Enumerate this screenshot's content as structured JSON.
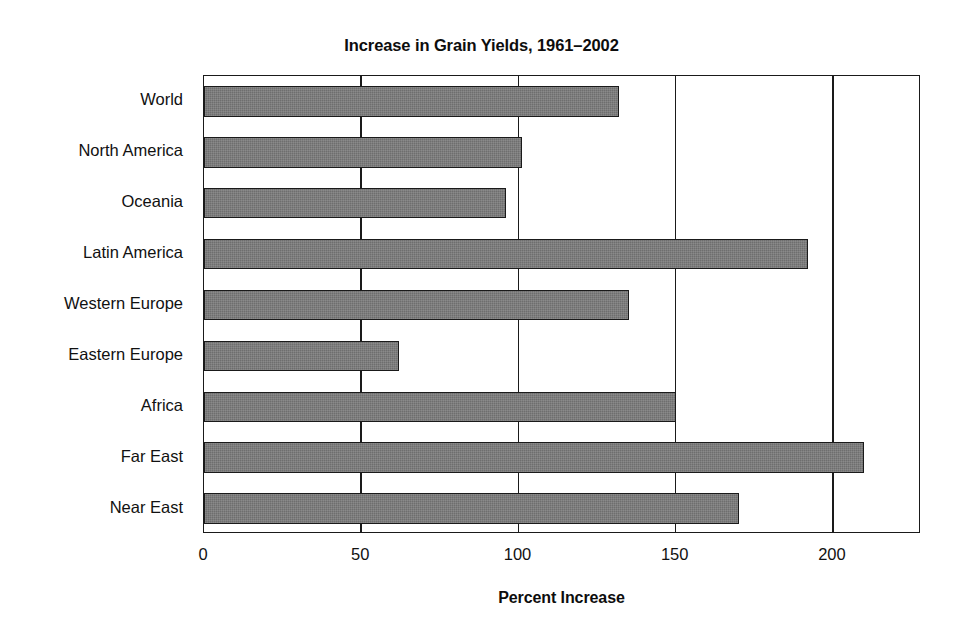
{
  "chart_data": {
    "type": "bar",
    "orientation": "horizontal",
    "title": "Increase in Grain Yields, 1961–2002",
    "xlabel": "Percent Increase",
    "ylabel": "",
    "categories": [
      "World",
      "North America",
      "Oceania",
      "Latin America",
      "Western Europe",
      "Eastern Europe",
      "Africa",
      "Far East",
      "Near East"
    ],
    "values": [
      132,
      101,
      96,
      192,
      135,
      62,
      150,
      210,
      170
    ],
    "xlim": [
      0,
      228
    ],
    "xticks": [
      0,
      50,
      100,
      150,
      200
    ],
    "xticklabels": [
      "0",
      "50",
      "100",
      "150",
      "200"
    ],
    "grid": "vertical",
    "legend": null,
    "bar_color": "#6e6e6e",
    "bar_edge_color": "#1a1a1a",
    "background_color": "#ffffff",
    "axis_color": "#1a1a1a"
  }
}
